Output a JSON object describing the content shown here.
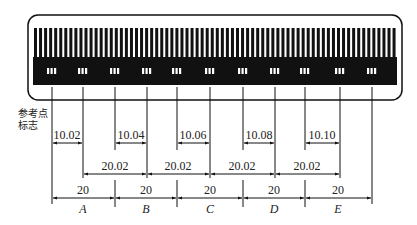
{
  "reference_label_line1": "参考点",
  "reference_label_line2": "标志",
  "row1": {
    "labels": [
      "10.02",
      "10.04",
      "10.06",
      "10.08",
      "10.10"
    ],
    "segments": [
      [
        52,
        83
      ],
      [
        115,
        147
      ],
      [
        177,
        210
      ],
      [
        243,
        275
      ],
      [
        305,
        340
      ]
    ]
  },
  "row2": {
    "labels": [
      "20.02",
      "20.02",
      "20.02",
      "20.02"
    ],
    "segments": [
      [
        83,
        147
      ],
      [
        147,
        210
      ],
      [
        210,
        275
      ],
      [
        275,
        340
      ]
    ]
  },
  "row3": {
    "labels": [
      "20",
      "20",
      "20",
      "20",
      "20"
    ],
    "segments": [
      [
        52,
        115
      ],
      [
        115,
        177
      ],
      [
        177,
        243
      ],
      [
        243,
        305
      ],
      [
        305,
        372
      ]
    ]
  },
  "sections": [
    "A",
    "B",
    "C",
    "D",
    "E"
  ],
  "colors": {
    "ink": "#111111",
    "paper": "#ffffff"
  }
}
